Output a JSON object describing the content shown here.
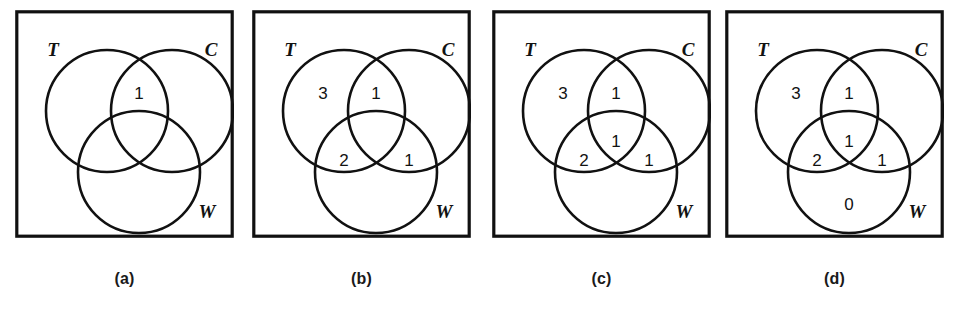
{
  "figure": {
    "background_color": "#ffffff",
    "ink_color": "#111111",
    "panel_count": 4
  },
  "panels": [
    {
      "id": "a",
      "caption": "(a)",
      "set_labels": {
        "left": "T",
        "right": "C",
        "bottom": "W"
      },
      "regions": [
        {
          "key": "T_only",
          "label": "",
          "visible": false,
          "x": 71,
          "y": 93
        },
        {
          "key": "C_only",
          "label": "",
          "visible": false,
          "x": 178,
          "y": 93
        },
        {
          "key": "T_and_C",
          "label": "1",
          "visible": true,
          "x": 124,
          "y": 85
        },
        {
          "key": "T_and_W",
          "label": "",
          "visible": false,
          "x": 97,
          "y": 150
        },
        {
          "key": "C_and_W",
          "label": "",
          "visible": false,
          "x": 152,
          "y": 150
        },
        {
          "key": "T_C_W",
          "label": "",
          "visible": false,
          "x": 124,
          "y": 128
        },
        {
          "key": "W_only",
          "label": "",
          "visible": false,
          "x": 124,
          "y": 195
        }
      ]
    },
    {
      "id": "b",
      "caption": "(b)",
      "set_labels": {
        "left": "T",
        "right": "C",
        "bottom": "W"
      },
      "regions": [
        {
          "key": "T_only",
          "label": "3",
          "visible": true,
          "x": 71,
          "y": 85
        },
        {
          "key": "C_only",
          "label": "",
          "visible": false,
          "x": 178,
          "y": 93
        },
        {
          "key": "T_and_C",
          "label": "1",
          "visible": true,
          "x": 124,
          "y": 85
        },
        {
          "key": "T_and_W",
          "label": "2",
          "visible": true,
          "x": 92,
          "y": 152
        },
        {
          "key": "C_and_W",
          "label": "1",
          "visible": true,
          "x": 157,
          "y": 152
        },
        {
          "key": "T_C_W",
          "label": "",
          "visible": false,
          "x": 124,
          "y": 128
        },
        {
          "key": "W_only",
          "label": "",
          "visible": false,
          "x": 124,
          "y": 195
        }
      ]
    },
    {
      "id": "c",
      "caption": "(c)",
      "set_labels": {
        "left": "T",
        "right": "C",
        "bottom": "W"
      },
      "regions": [
        {
          "key": "T_only",
          "label": "3",
          "visible": true,
          "x": 71,
          "y": 85
        },
        {
          "key": "C_only",
          "label": "",
          "visible": false,
          "x": 178,
          "y": 93
        },
        {
          "key": "T_and_C",
          "label": "1",
          "visible": true,
          "x": 124,
          "y": 85
        },
        {
          "key": "T_and_W",
          "label": "2",
          "visible": true,
          "x": 92,
          "y": 152
        },
        {
          "key": "C_and_W",
          "label": "1",
          "visible": true,
          "x": 157,
          "y": 152
        },
        {
          "key": "T_C_W",
          "label": "1",
          "visible": true,
          "x": 124,
          "y": 133
        },
        {
          "key": "W_only",
          "label": "",
          "visible": false,
          "x": 124,
          "y": 195
        }
      ]
    },
    {
      "id": "d",
      "caption": "(d)",
      "set_labels": {
        "left": "T",
        "right": "C",
        "bottom": "W"
      },
      "regions": [
        {
          "key": "T_only",
          "label": "3",
          "visible": true,
          "x": 71,
          "y": 85
        },
        {
          "key": "C_only",
          "label": "",
          "visible": false,
          "x": 178,
          "y": 93
        },
        {
          "key": "T_and_C",
          "label": "1",
          "visible": true,
          "x": 124,
          "y": 85
        },
        {
          "key": "T_and_W",
          "label": "2",
          "visible": true,
          "x": 92,
          "y": 152
        },
        {
          "key": "C_and_W",
          "label": "1",
          "visible": true,
          "x": 157,
          "y": 152
        },
        {
          "key": "T_C_W",
          "label": "1",
          "visible": true,
          "x": 124,
          "y": 133
        },
        {
          "key": "W_only",
          "label": "0",
          "visible": true,
          "x": 124,
          "y": 196
        }
      ]
    }
  ],
  "geometry": {
    "panel_width": 219,
    "panel_height": 228,
    "panel_tops": 10,
    "panel_lefts": [
      15,
      252,
      492,
      725
    ],
    "caption_y": 270,
    "circle_radius": 61,
    "circle_T": {
      "cx": 92,
      "cy": 101
    },
    "circle_C": {
      "cx": 157,
      "cy": 101
    },
    "circle_W": {
      "cx": 124,
      "cy": 162
    },
    "label_T": {
      "x": 38,
      "y": 46
    },
    "label_C": {
      "x": 196,
      "y": 46
    },
    "label_W": {
      "x": 192,
      "y": 208
    }
  }
}
